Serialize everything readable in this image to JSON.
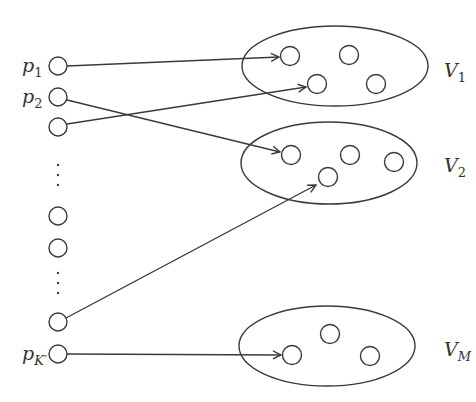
{
  "diagram": {
    "colors": {
      "stroke": "#3a3a3a",
      "background": "#ffffff",
      "text": "#333333"
    },
    "left_nodes": [
      {
        "id": "p1",
        "label": "p",
        "sub": "1",
        "x": 58,
        "y": 66
      },
      {
        "id": "p2",
        "label": "p",
        "sub": "2",
        "x": 58,
        "y": 97
      },
      {
        "id": "n3",
        "label": "",
        "sub": "",
        "x": 58,
        "y": 127
      },
      {
        "id": "n4",
        "label": "",
        "sub": "",
        "x": 58,
        "y": 216
      },
      {
        "id": "n5",
        "label": "",
        "sub": "",
        "x": 58,
        "y": 248
      },
      {
        "id": "n6",
        "label": "",
        "sub": "",
        "x": 58,
        "y": 322
      },
      {
        "id": "pK",
        "label": "p",
        "sub": "K′",
        "x": 58,
        "y": 354
      }
    ],
    "ellipsis_dots": [
      {
        "x": 58,
        "y": 165
      },
      {
        "x": 58,
        "y": 175
      },
      {
        "x": 58,
        "y": 185
      },
      {
        "x": 58,
        "y": 273
      },
      {
        "x": 58,
        "y": 283
      },
      {
        "x": 58,
        "y": 293
      }
    ],
    "groups": [
      {
        "id": "V1",
        "label": "V",
        "sub": "1",
        "cx": 335,
        "cy": 66,
        "rx": 93,
        "ry": 40,
        "label_x": 444,
        "label_y": 77,
        "nodes": [
          {
            "x": 290,
            "y": 56
          },
          {
            "x": 349,
            "y": 55
          },
          {
            "x": 317,
            "y": 84
          },
          {
            "x": 376,
            "y": 84
          }
        ]
      },
      {
        "id": "V2",
        "label": "V",
        "sub": "2",
        "cx": 329,
        "cy": 163,
        "rx": 88,
        "ry": 41,
        "label_x": 444,
        "label_y": 172,
        "nodes": [
          {
            "x": 291,
            "y": 155
          },
          {
            "x": 350,
            "y": 155
          },
          {
            "x": 328,
            "y": 177
          },
          {
            "x": 394,
            "y": 162
          }
        ]
      },
      {
        "id": "VM",
        "label": "V",
        "sub": "M",
        "cx": 327,
        "cy": 346,
        "rx": 88,
        "ry": 40,
        "label_x": 444,
        "label_y": 356,
        "nodes": [
          {
            "x": 292,
            "y": 355
          },
          {
            "x": 330,
            "y": 334
          },
          {
            "x": 370,
            "y": 356
          }
        ]
      }
    ],
    "edges": [
      {
        "from": "p1",
        "x1": 67,
        "y1": 66,
        "x2": 279,
        "y2": 57
      },
      {
        "from": "p2",
        "x1": 67,
        "y1": 100,
        "x2": 280,
        "y2": 152
      },
      {
        "from": "n3",
        "x1": 67,
        "y1": 124,
        "x2": 306,
        "y2": 87
      },
      {
        "from": "n6",
        "x1": 66,
        "y1": 318,
        "x2": 316,
        "y2": 185
      },
      {
        "from": "pK",
        "x1": 67,
        "y1": 354,
        "x2": 281,
        "y2": 355
      }
    ]
  }
}
